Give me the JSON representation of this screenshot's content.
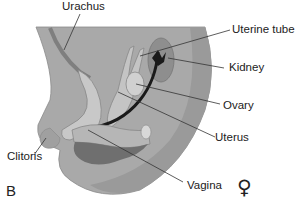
{
  "figure": {
    "panel_letter": "B",
    "sex_symbol": "♀",
    "labels": [
      {
        "id": "urachus",
        "text": "Urachus"
      },
      {
        "id": "uterine-tube",
        "text": "Uterine tube"
      },
      {
        "id": "kidney",
        "text": "Kidney"
      },
      {
        "id": "ovary",
        "text": "Ovary"
      },
      {
        "id": "uterus",
        "text": "Uterus"
      },
      {
        "id": "clitoris",
        "text": "Clitoris"
      },
      {
        "id": "vagina",
        "text": "Vagina"
      }
    ],
    "colors": {
      "body": "#a9a9a9",
      "body_dark": "#8e8e8e",
      "organ_light": "#c6c6c6",
      "organ_mid": "#9a9a9a",
      "rectum_dark": "#6f6f6f",
      "kidney": "#8a8a8a",
      "ureter": "#1a1a1a",
      "leader": "#333333"
    }
  }
}
